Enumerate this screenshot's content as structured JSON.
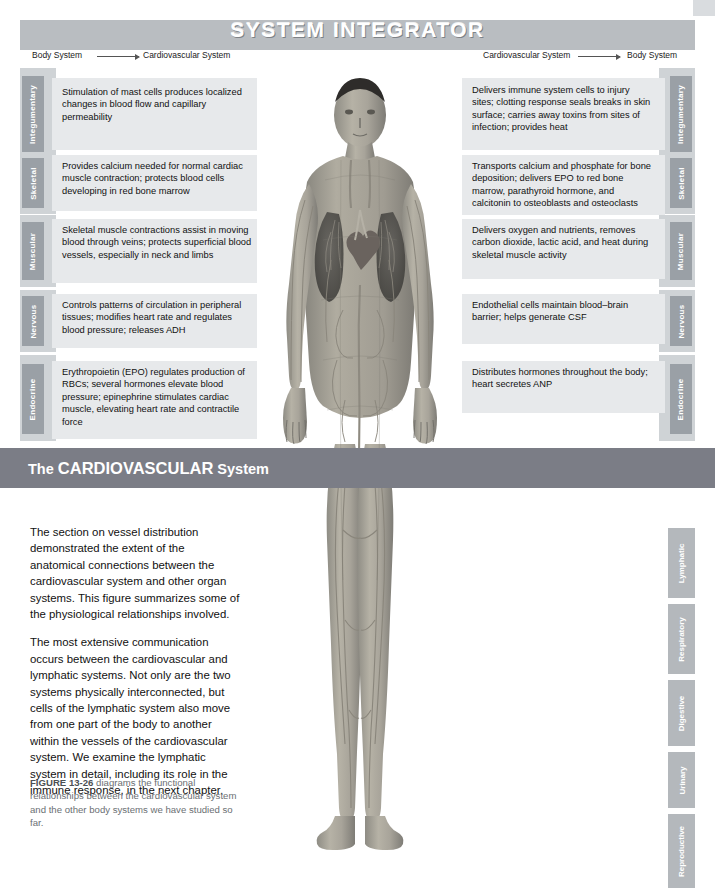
{
  "banner": {
    "title": "SYSTEM INTEGRATOR"
  },
  "direction": {
    "left_from": "Body System",
    "left_to": "Cardiovascular System",
    "right_from": "Cardiovascular System",
    "right_to": "Body System"
  },
  "left_column": [
    {
      "tab": "Integumentary",
      "text": "Stimulation of mast cells produces localized changes in blood flow and capillary permeability"
    },
    {
      "tab": "Skeletal",
      "text": "Provides calcium needed for normal cardiac muscle contraction; protects blood cells developing in red bone marrow"
    },
    {
      "tab": "Muscular",
      "text": "Skeletal muscle contractions assist in moving blood through veins; protects superficial blood vessels, especially in neck and limbs"
    },
    {
      "tab": "Nervous",
      "text": "Controls patterns of circulation in peripheral tissues; modifies heart rate and regulates blood pressure; releases ADH"
    },
    {
      "tab": "Endocrine",
      "text": "Erythropoietin (EPO) regulates production of RBCs; several hormones elevate blood pressure; epinephrine stimulates cardiac muscle, elevating heart rate and contractile force"
    }
  ],
  "right_column": [
    {
      "tab": "Integumentary",
      "text": "Delivers immune system cells to injury sites; clotting response seals breaks in skin surface; carries away toxins from sites of infection; provides heat"
    },
    {
      "tab": "Skeletal",
      "text": "Transports calcium and phosphate for bone deposition; delivers EPO to red bone marrow, parathyroid hormone, and calcitonin to osteoblasts and osteoclasts"
    },
    {
      "tab": "Muscular",
      "text": "Delivers oxygen and nutrients, removes carbon dioxide, lactic acid, and heat during skeletal muscle activity"
    },
    {
      "tab": "Nervous",
      "text": "Endothelial cells maintain blood–brain barrier; helps generate CSF"
    },
    {
      "tab": "Endocrine",
      "text": "Distributes hormones throughout the body; heart secretes ANP"
    }
  ],
  "section_bar": {
    "prefix": "The ",
    "system": "CARDIOVASCULAR",
    "suffix": " System"
  },
  "body_text": {
    "p1": "The section on vessel distribution demonstrated the extent of the anatomical connections between the cardiovascular system and other organ systems. This figure summarizes some of the physiological relationships involved.",
    "p2": "The most extensive communication occurs between the cardiovascular and lymphatic systems. Not only are the two systems physically interconnected, but cells of the lymphatic system also move from one part of the body to another within the vessels of the cardiovascular system. We examine the lymphatic system in detail, including its role in the immune response, in the next chapter."
  },
  "figure_caption": {
    "label": "FIGURE 13-26",
    "text": " diagrams the functional relationships between the cardiovascular system and the other body systems we have studied so far."
  },
  "lower_tabs": [
    {
      "tab": "Lymphatic"
    },
    {
      "tab": "Respiratory"
    },
    {
      "tab": "Digestive"
    },
    {
      "tab": "Urinary"
    },
    {
      "tab": "Reproductive"
    }
  ],
  "colors": {
    "banner": "#b9bdc1",
    "tab": "#9aa0a6",
    "callout": "#e7e9eb",
    "band": "#cfd3d6",
    "section_bar": "#7b7d86",
    "lower_tab": "#b4b8bc"
  }
}
